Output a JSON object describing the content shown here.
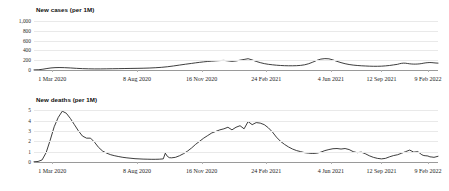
{
  "chart_data": [
    {
      "type": "line",
      "title": "New cases (per 1M)",
      "xlabel": "",
      "ylabel": "",
      "ylim": [
        0,
        1100
      ],
      "yticks": [
        "0",
        "200",
        "400",
        "600",
        "800",
        "1,000"
      ],
      "ytick_values": [
        0,
        200,
        400,
        600,
        800,
        1000
      ],
      "grid": true,
      "legend": "none",
      "xtick_labels": [
        "1 Mar 2020",
        "8 Aug 2020",
        "16 Nov 2020",
        "24 Feb 2021",
        "4 Jun 2021",
        "12 Sep 2021",
        "9 Feb 2022"
      ],
      "xtick_positions": [
        0.045,
        0.255,
        0.415,
        0.575,
        0.735,
        0.86,
        0.975
      ],
      "series": [
        {
          "name": "New cases per 1M",
          "x": [
            0,
            0.012,
            0.022,
            0.032,
            0.042,
            0.052,
            0.062,
            0.075,
            0.09,
            0.105,
            0.12,
            0.135,
            0.15,
            0.165,
            0.18,
            0.195,
            0.21,
            0.225,
            0.24,
            0.255,
            0.27,
            0.285,
            0.3,
            0.315,
            0.33,
            0.345,
            0.36,
            0.375,
            0.39,
            0.4,
            0.41,
            0.42,
            0.43,
            0.44,
            0.45,
            0.46,
            0.47,
            0.48,
            0.49,
            0.5,
            0.51,
            0.52,
            0.53,
            0.54,
            0.55,
            0.56,
            0.57,
            0.58,
            0.59,
            0.6,
            0.61,
            0.62,
            0.63,
            0.64,
            0.65,
            0.66,
            0.67,
            0.68,
            0.69,
            0.7,
            0.71,
            0.72,
            0.73,
            0.74,
            0.75,
            0.76,
            0.77,
            0.78,
            0.79,
            0.8,
            0.81,
            0.82,
            0.83,
            0.84,
            0.85,
            0.86,
            0.87,
            0.88,
            0.89,
            0.9,
            0.905,
            0.91,
            0.915,
            0.92,
            0.925,
            0.93,
            0.935,
            0.94,
            0.945,
            0.95,
            0.955,
            0.96,
            0.965,
            0.97,
            0.975,
            0.98,
            0.985,
            0.99,
            0.995,
            1.0
          ],
          "y": [
            2,
            6,
            16,
            30,
            42,
            48,
            50,
            48,
            42,
            34,
            28,
            24,
            22,
            22,
            24,
            26,
            28,
            30,
            32,
            34,
            36,
            40,
            46,
            54,
            66,
            82,
            100,
            118,
            134,
            146,
            156,
            166,
            174,
            180,
            186,
            192,
            196,
            186,
            176,
            184,
            200,
            215,
            230,
            205,
            175,
            150,
            130,
            116,
            106,
            98,
            92,
            88,
            86,
            86,
            88,
            94,
            106,
            128,
            160,
            196,
            222,
            232,
            228,
            205,
            176,
            150,
            128,
            112,
            100,
            92,
            86,
            82,
            78,
            76,
            76,
            78,
            84,
            92,
            104,
            116,
            128,
            136,
            140,
            138,
            132,
            126,
            122,
            120,
            120,
            122,
            126,
            132,
            140,
            146,
            150,
            152,
            150,
            146,
            142,
            140
          ]
        }
      ],
      "annotations": {
        "omicron_peak_value": 1050,
        "omicron_peak_label": "9 Feb 2022",
        "final_value": 280
      }
    },
    {
      "type": "line",
      "title": "New deaths (per 1M)",
      "xlabel": "",
      "ylabel": "",
      "ylim": [
        0,
        5.4
      ],
      "yticks": [
        "0",
        "1",
        "2",
        "3",
        "4",
        "5"
      ],
      "ytick_values": [
        0,
        1,
        2,
        3,
        4,
        5
      ],
      "grid": true,
      "legend": "none",
      "xtick_labels": [
        "1 Mar 2020",
        "8 Aug 2020",
        "16 Nov 2020",
        "24 Feb 2021",
        "4 Jun 2021",
        "12 Sep 2021",
        "9 Feb 2022"
      ],
      "xtick_positions": [
        0.045,
        0.255,
        0.415,
        0.575,
        0.735,
        0.86,
        0.975
      ],
      "series": [
        {
          "name": "New deaths per 1M",
          "x": [
            0,
            0.01,
            0.02,
            0.03,
            0.04,
            0.05,
            0.06,
            0.07,
            0.08,
            0.09,
            0.1,
            0.11,
            0.12,
            0.13,
            0.14,
            0.15,
            0.16,
            0.17,
            0.18,
            0.19,
            0.2,
            0.21,
            0.22,
            0.23,
            0.24,
            0.25,
            0.26,
            0.27,
            0.28,
            0.29,
            0.3,
            0.31,
            0.32,
            0.325,
            0.33,
            0.335,
            0.34,
            0.35,
            0.36,
            0.37,
            0.38,
            0.39,
            0.4,
            0.41,
            0.42,
            0.43,
            0.44,
            0.45,
            0.46,
            0.47,
            0.48,
            0.49,
            0.5,
            0.51,
            0.52,
            0.53,
            0.54,
            0.55,
            0.56,
            0.57,
            0.58,
            0.59,
            0.6,
            0.61,
            0.62,
            0.63,
            0.64,
            0.65,
            0.66,
            0.67,
            0.68,
            0.69,
            0.7,
            0.71,
            0.72,
            0.73,
            0.74,
            0.75,
            0.76,
            0.77,
            0.78,
            0.79,
            0.8,
            0.81,
            0.82,
            0.83,
            0.84,
            0.85,
            0.86,
            0.87,
            0.88,
            0.89,
            0.9,
            0.91,
            0.92,
            0.93,
            0.94,
            0.95,
            0.955,
            0.96,
            0.965,
            0.97,
            0.975,
            0.98,
            0.985,
            0.99,
            0.995,
            1.0
          ],
          "y": [
            0.02,
            0.05,
            0.2,
            0.9,
            2.1,
            3.4,
            4.3,
            4.9,
            4.7,
            4.2,
            3.6,
            3.0,
            2.5,
            2.3,
            2.3,
            1.9,
            1.4,
            1.05,
            0.85,
            0.7,
            0.6,
            0.52,
            0.45,
            0.4,
            0.36,
            0.32,
            0.3,
            0.28,
            0.27,
            0.26,
            0.26,
            0.27,
            0.3,
            0.85,
            0.55,
            0.42,
            0.4,
            0.45,
            0.6,
            0.8,
            1.05,
            1.35,
            1.7,
            2.0,
            2.3,
            2.55,
            2.8,
            2.95,
            3.1,
            3.2,
            3.35,
            3.1,
            3.35,
            3.5,
            3.2,
            3.9,
            3.6,
            3.8,
            3.75,
            3.6,
            3.3,
            2.9,
            2.4,
            2.0,
            1.7,
            1.45,
            1.25,
            1.1,
            1.0,
            0.9,
            0.85,
            0.82,
            0.85,
            0.95,
            1.1,
            1.2,
            1.28,
            1.3,
            1.25,
            1.3,
            1.2,
            1.0,
            0.9,
            0.95,
            0.8,
            0.6,
            0.45,
            0.35,
            0.3,
            0.35,
            0.5,
            0.62,
            0.7,
            0.85,
            1.0,
            1.15,
            0.95,
            1.0,
            0.85,
            0.7,
            0.62,
            0.6,
            0.58,
            0.5,
            0.48,
            0.45,
            0.5,
            0.55
          ]
        }
      ],
      "annotations": {
        "first_wave_peak_value": 5.0,
        "omicron_peak_value": 4.2,
        "final_value": 3.4
      }
    }
  ],
  "panels": [
    {
      "id": "cases",
      "title": "New cases (per 1M)"
    },
    {
      "id": "deaths",
      "title": "New deaths (per 1M)"
    }
  ],
  "colors": {
    "line": "#1b1b1b",
    "grid": "#e9e9e9",
    "axis": "#9a9a9a",
    "background": "#ffffff",
    "text": "#1a1a1a"
  }
}
